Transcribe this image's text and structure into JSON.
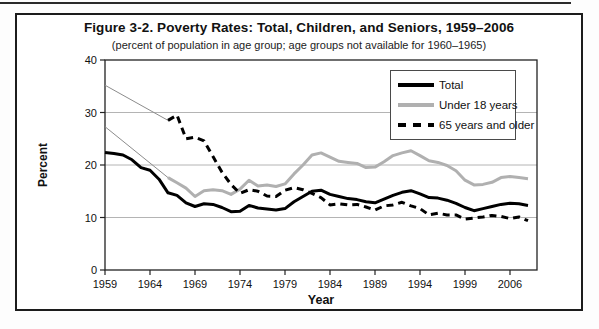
{
  "figure": {
    "title": "Figure 3-2. Poverty Rates: Total, Children, and Seniors, 1959–2006",
    "subtitle": "(percent of population in age group; age groups not available for 1960–1965)"
  },
  "chart_data": {
    "type": "line",
    "title": "Figure 3-2. Poverty Rates: Total, Children, and Seniors, 1959–2006",
    "subtitle": "(percent of population in age group; age groups not available for 1960–1965)",
    "xlabel": "Year",
    "ylabel": "Percent",
    "ylim": [
      0,
      40
    ],
    "yticks": [
      0,
      10,
      20,
      30,
      40
    ],
    "gridlines_y": [
      10,
      20,
      30
    ],
    "grid": "horizontal only",
    "legend_position": "top-right inside plot",
    "xticks": [
      {
        "year": 1959,
        "label": "1959"
      },
      {
        "year": 1964,
        "label": "1964"
      },
      {
        "year": 1969,
        "label": "1969"
      },
      {
        "year": 1974,
        "label": "1974"
      },
      {
        "year": 1979,
        "label": "1979"
      },
      {
        "year": 1984,
        "label": "1984"
      },
      {
        "year": 1989,
        "label": "1989"
      },
      {
        "year": 1994,
        "label": "1994"
      },
      {
        "year": 1999,
        "label": "1999"
      },
      {
        "year": 2004,
        "label": "2006"
      }
    ],
    "years": [
      1959,
      1960,
      1961,
      1962,
      1963,
      1964,
      1965,
      1966,
      1967,
      1968,
      1969,
      1970,
      1971,
      1972,
      1973,
      1974,
      1975,
      1976,
      1977,
      1978,
      1979,
      1980,
      1981,
      1982,
      1983,
      1984,
      1985,
      1986,
      1987,
      1988,
      1989,
      1990,
      1991,
      1992,
      1993,
      1994,
      1995,
      1996,
      1997,
      1998,
      1999,
      2000,
      2001,
      2002,
      2003,
      2004,
      2005,
      2006
    ],
    "series": [
      {
        "name": "Total",
        "color": "#000000",
        "style": "solid",
        "width": 3,
        "values": [
          22.4,
          22.2,
          21.9,
          21.0,
          19.5,
          19.0,
          17.3,
          14.7,
          14.2,
          12.8,
          12.1,
          12.6,
          12.5,
          11.9,
          11.1,
          11.2,
          12.3,
          11.8,
          11.6,
          11.4,
          11.7,
          13.0,
          14.0,
          15.0,
          15.2,
          14.4,
          14.0,
          13.6,
          13.4,
          13.0,
          12.8,
          13.5,
          14.2,
          14.8,
          15.1,
          14.5,
          13.8,
          13.7,
          13.3,
          12.7,
          11.9,
          11.3,
          11.7,
          12.1,
          12.5,
          12.7,
          12.6,
          12.3
        ]
      },
      {
        "name": "Under 18 years",
        "color": "#b0b0b0",
        "style": "solid",
        "width": 3,
        "values": [
          27.3,
          null,
          null,
          null,
          null,
          null,
          null,
          17.6,
          16.6,
          15.6,
          14.0,
          15.1,
          15.3,
          15.1,
          14.4,
          15.4,
          17.1,
          16.0,
          16.2,
          15.9,
          16.4,
          18.3,
          20.0,
          21.9,
          22.3,
          21.5,
          20.7,
          20.5,
          20.3,
          19.5,
          19.6,
          20.6,
          21.8,
          22.3,
          22.7,
          21.8,
          20.8,
          20.5,
          19.9,
          18.9,
          17.1,
          16.2,
          16.3,
          16.7,
          17.6,
          17.8,
          17.6,
          17.4
        ]
      },
      {
        "name": "65 years and older",
        "color": "#000000",
        "style": "dashed",
        "width": 3,
        "values": [
          35.2,
          null,
          null,
          null,
          null,
          null,
          null,
          28.5,
          29.5,
          25.0,
          25.3,
          24.6,
          21.6,
          18.6,
          16.3,
          14.6,
          15.3,
          15.0,
          14.1,
          14.0,
          15.2,
          15.7,
          15.3,
          14.6,
          13.8,
          12.4,
          12.6,
          12.4,
          12.5,
          12.0,
          11.4,
          12.2,
          12.4,
          12.9,
          12.2,
          11.7,
          10.5,
          10.8,
          10.5,
          10.5,
          9.7,
          9.9,
          10.1,
          10.4,
          10.2,
          9.8,
          10.1,
          9.4
        ]
      }
    ],
    "gap_note": "Thin straight hairlines connect the 1959 value to the 1966 value for the two age-group series (1960–1965 not available)",
    "gap_connector_color": "#8c8c8c"
  },
  "colors": {
    "gridline": "#b4b4b4",
    "plot_border": "#222222",
    "outer_border": "#1c1c1c",
    "gray_series": "#b0b0b0"
  }
}
